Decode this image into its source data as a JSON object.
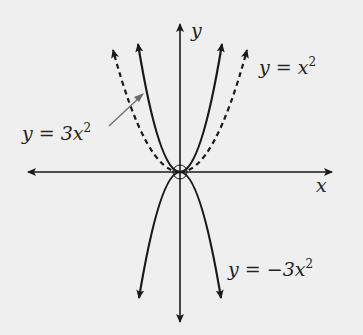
{
  "diagram": {
    "title": "",
    "background": "#efefef",
    "ink_color": "#1a1a1a",
    "axes": {
      "x_label": "x",
      "y_label": "y",
      "arrows": "both-ends"
    },
    "curves": [
      {
        "name": "y = x^2",
        "expression": "x^2",
        "style": "dashed",
        "label_var": "y",
        "label_eq": "=",
        "label_rhs": "x",
        "label_exp": "2"
      },
      {
        "name": "y = 3x^2",
        "expression": "3x^2",
        "style": "solid",
        "label_var": "y",
        "label_eq": "=",
        "label_rhs": "3x",
        "label_exp": "2",
        "has_pointer_arrow": true
      },
      {
        "name": "y = -3x^2",
        "expression": "-3x^2",
        "style": "solid",
        "label_var": "y",
        "label_eq": "=",
        "label_rhs": "−3x",
        "label_exp": "2"
      }
    ],
    "annotations": {
      "origin_marker": "circle"
    }
  }
}
